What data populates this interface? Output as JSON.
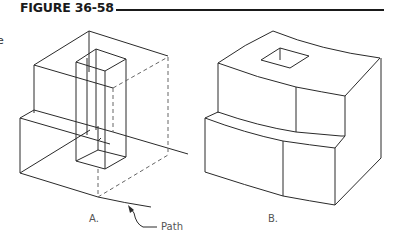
{
  "figure": {
    "title": "FIGURE 36-58",
    "clipped_left_text": "e"
  },
  "panels": [
    {
      "id": "A",
      "label": "A.",
      "description": "Isometric block with vertical rectangular prism cut through, hidden lines dashed, path annotation"
    },
    {
      "id": "B",
      "label": "B.",
      "description": "Deformed isometric block with square hole on top surface"
    }
  ],
  "annotations": {
    "path_label": "Path"
  },
  "colors": {
    "line": "#2a2a2a",
    "hidden_line": "#666666",
    "background": "#ffffff"
  }
}
